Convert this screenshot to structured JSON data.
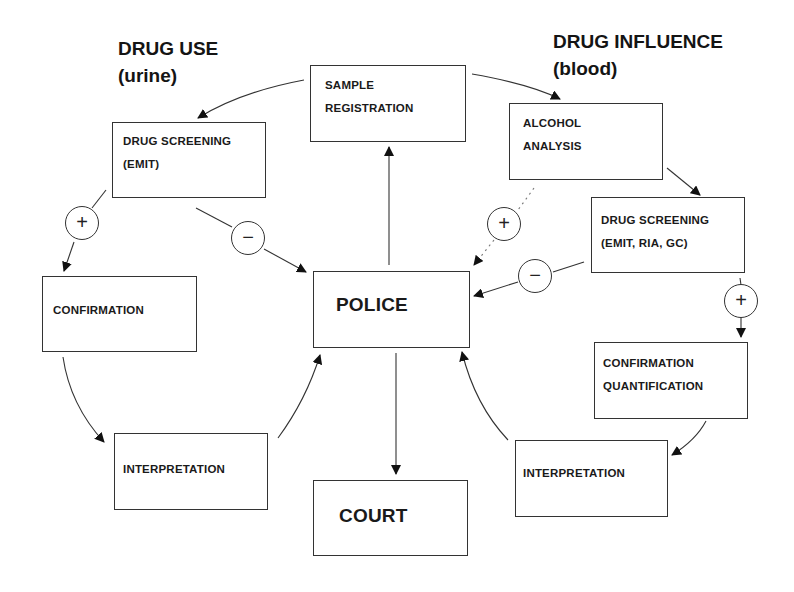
{
  "headings": {
    "left_title": "DRUG USE",
    "left_sub": "(urine)",
    "right_title": "DRUG INFLUENCE",
    "right_sub": "(blood)"
  },
  "nodes": {
    "sample_registration": {
      "line1": "SAMPLE",
      "line2": "REGISTRATION"
    },
    "police": {
      "label": "POLICE"
    },
    "court": {
      "label": "COURT"
    },
    "urine_screening": {
      "line1": "DRUG SCREENING",
      "line2": "(EMIT)"
    },
    "urine_confirmation": {
      "label": "CONFIRMATION"
    },
    "urine_interpretation": {
      "label": "INTERPRETATION"
    },
    "alcohol_analysis": {
      "line1": "ALCOHOL",
      "line2": "ANALYSIS"
    },
    "blood_screening": {
      "line1": "DRUG SCREENING",
      "line2": "(EMIT, RIA, GC)"
    },
    "blood_confirmation": {
      "line1": "CONFIRMATION",
      "line2": "QUANTIFICATION"
    },
    "blood_interpretation": {
      "label": "INTERPRETATION"
    }
  },
  "signs": {
    "urine_positive": "+",
    "urine_negative": "−",
    "alcohol_positive": "+",
    "blood_negative": "−",
    "blood_positive": "+"
  },
  "edges": [
    {
      "from": "police",
      "to": "sample_registration",
      "style": "solid"
    },
    {
      "from": "sample_registration",
      "to": "urine_screening",
      "style": "solid"
    },
    {
      "from": "sample_registration",
      "to": "alcohol_analysis",
      "style": "solid"
    },
    {
      "from": "urine_screening",
      "to": "urine_confirmation",
      "style": "solid",
      "sign": "+"
    },
    {
      "from": "urine_screening",
      "to": "police",
      "style": "solid",
      "sign": "-"
    },
    {
      "from": "urine_confirmation",
      "to": "urine_interpretation",
      "style": "solid"
    },
    {
      "from": "urine_interpretation",
      "to": "police",
      "style": "solid"
    },
    {
      "from": "alcohol_analysis",
      "to": "blood_screening",
      "style": "solid"
    },
    {
      "from": "alcohol_analysis",
      "to": "police",
      "style": "dotted",
      "sign": "+"
    },
    {
      "from": "blood_screening",
      "to": "police",
      "style": "solid",
      "sign": "-"
    },
    {
      "from": "blood_screening",
      "to": "blood_confirmation",
      "style": "solid",
      "sign": "+"
    },
    {
      "from": "blood_confirmation",
      "to": "blood_interpretation",
      "style": "solid"
    },
    {
      "from": "blood_interpretation",
      "to": "police",
      "style": "solid"
    },
    {
      "from": "police",
      "to": "court",
      "style": "solid"
    }
  ],
  "colors": {
    "line": "#333333",
    "text": "#141414",
    "background": "#ffffff"
  }
}
